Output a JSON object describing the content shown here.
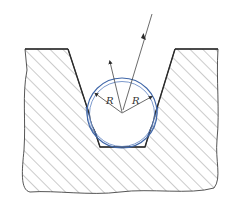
{
  "diagram": {
    "title": "",
    "labels": {
      "radius_left": "R",
      "radius_right": "R"
    },
    "colors": {
      "outline": "#2b2b2b",
      "hatch": "#6a6a6a",
      "circle_blue": "#3f66a8",
      "circle_inner": "#5a7fbf",
      "background": "#ffffff"
    },
    "geometry": {
      "circle_center": [
        122,
        113
      ],
      "circle_radius": 33,
      "groove_bottom_y": 147,
      "block_top_y": 49
    },
    "elements": [
      "hatched-workpiece-section",
      "v-groove",
      "ball-circle",
      "radius-dimension-left",
      "radius-dimension-right",
      "incident-arrow",
      "normal-arrow"
    ]
  }
}
